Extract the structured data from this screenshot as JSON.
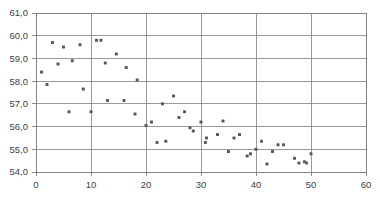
{
  "chart_data": {
    "type": "scatter",
    "title": "",
    "xlabel": "",
    "ylabel": "",
    "xlim": [
      0,
      60
    ],
    "ylim": [
      54.0,
      61.0
    ],
    "xticks": [
      0,
      10,
      20,
      30,
      40,
      50,
      60
    ],
    "yticks": [
      54.0,
      55.0,
      56.0,
      57.0,
      58.0,
      59.0,
      60.0,
      61.0
    ],
    "xtick_labels": [
      "0",
      "10",
      "20",
      "30",
      "40",
      "50",
      "60"
    ],
    "ytick_labels": [
      "54,0",
      "55,0",
      "56,0",
      "57,0",
      "58,0",
      "59,0",
      "60,0",
      "61,0"
    ],
    "grid": true,
    "grid_color": "#808080",
    "axis_color": "#808080",
    "marker_color": "#595959",
    "marker_size": 3,
    "legend": null,
    "series": [
      {
        "name": "series-1",
        "points": [
          [
            1,
            58.4
          ],
          [
            2,
            57.85
          ],
          [
            3,
            59.7
          ],
          [
            4,
            58.75
          ],
          [
            5,
            59.5
          ],
          [
            6,
            56.65
          ],
          [
            6.6,
            58.9
          ],
          [
            8,
            59.6
          ],
          [
            8.6,
            57.65
          ],
          [
            10,
            56.65
          ],
          [
            11,
            59.8
          ],
          [
            11.8,
            59.8
          ],
          [
            12.6,
            58.8
          ],
          [
            13,
            57.15
          ],
          [
            14.6,
            59.2
          ],
          [
            16,
            57.15
          ],
          [
            16.4,
            58.6
          ],
          [
            18,
            56.55
          ],
          [
            18.4,
            58.05
          ],
          [
            20,
            56.05
          ],
          [
            21,
            56.2
          ],
          [
            22,
            55.3
          ],
          [
            23,
            57.0
          ],
          [
            23.6,
            55.35
          ],
          [
            25,
            57.35
          ],
          [
            26,
            56.4
          ],
          [
            27,
            56.65
          ],
          [
            28,
            55.95
          ],
          [
            28.6,
            55.8
          ],
          [
            30,
            56.2
          ],
          [
            30.8,
            55.3
          ],
          [
            31,
            55.5
          ],
          [
            33,
            55.65
          ],
          [
            34,
            56.25
          ],
          [
            35,
            54.9
          ],
          [
            36,
            55.5
          ],
          [
            37,
            55.65
          ],
          [
            38.4,
            54.7
          ],
          [
            39,
            54.8
          ],
          [
            40,
            55.0
          ],
          [
            41,
            55.35
          ],
          [
            42,
            54.35
          ],
          [
            43,
            54.9
          ],
          [
            44,
            55.2
          ],
          [
            45,
            55.2
          ],
          [
            47,
            54.6
          ],
          [
            47.8,
            54.4
          ],
          [
            48.8,
            54.45
          ],
          [
            49.2,
            54.4
          ],
          [
            50,
            54.8
          ]
        ]
      }
    ]
  },
  "axes": {
    "plot_left": 36,
    "plot_right": 366,
    "plot_top": 13,
    "plot_bottom": 172
  }
}
